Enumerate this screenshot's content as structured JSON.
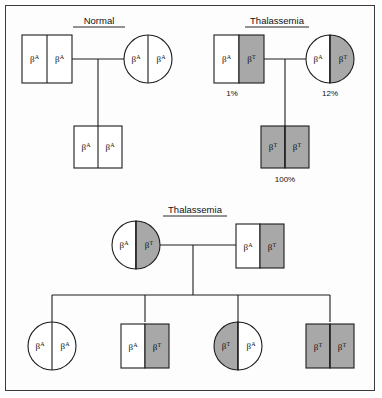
{
  "figure": {
    "title_normal": "Normal",
    "title_thalassemia": "Thalassemia",
    "allele_normal": "β",
    "allele_normal_sup": "A",
    "allele_thal": "β",
    "allele_thal_sup": "T",
    "colors": {
      "affected_fill": "#a8a8a8",
      "unaffected_fill": "#ffffff",
      "stroke": "#1d1d1d",
      "background": "#fdfdfd",
      "frame": "#3b3b3b"
    }
  },
  "panels": [
    {
      "id": "panel-normal",
      "title": "Normal",
      "parents": [
        {
          "role": "father",
          "sex": "male",
          "shape": "square",
          "left_allele": "β",
          "left_sup": "A",
          "right_allele": "β",
          "right_sup": "A",
          "left_shaded": false,
          "right_shaded": false,
          "percent": ""
        },
        {
          "role": "mother",
          "sex": "female",
          "shape": "circle",
          "left_allele": "β",
          "left_sup": "A",
          "right_allele": "β",
          "right_sup": "A",
          "left_shaded": false,
          "right_shaded": false,
          "percent": ""
        }
      ],
      "children": [
        {
          "role": "child",
          "sex": "male",
          "shape": "square",
          "left_allele": "β",
          "left_sup": "A",
          "right_allele": "β",
          "right_sup": "A",
          "left_shaded": false,
          "right_shaded": false,
          "percent": ""
        }
      ]
    },
    {
      "id": "panel-thalassemia-top",
      "title": "Thalassemia",
      "parents": [
        {
          "role": "father",
          "sex": "male",
          "shape": "square",
          "left_allele": "β",
          "left_sup": "A",
          "right_allele": "β",
          "right_sup": "T",
          "left_shaded": false,
          "right_shaded": true,
          "percent": "1%"
        },
        {
          "role": "mother",
          "sex": "female",
          "shape": "circle",
          "left_allele": "β",
          "left_sup": "A",
          "right_allele": "β",
          "right_sup": "T",
          "left_shaded": false,
          "right_shaded": true,
          "percent": "12%"
        }
      ],
      "children": [
        {
          "role": "child",
          "sex": "male",
          "shape": "square",
          "left_allele": "β",
          "left_sup": "T",
          "right_allele": "β",
          "right_sup": "T",
          "left_shaded": true,
          "right_shaded": true,
          "percent": "100%"
        }
      ]
    },
    {
      "id": "panel-thalassemia-bottom",
      "title": "Thalassemia",
      "parents": [
        {
          "role": "mother",
          "sex": "female",
          "shape": "circle",
          "left_allele": "β",
          "left_sup": "A",
          "right_allele": "β",
          "right_sup": "T",
          "left_shaded": false,
          "right_shaded": true,
          "percent": ""
        },
        {
          "role": "father",
          "sex": "male",
          "shape": "square",
          "left_allele": "β",
          "left_sup": "A",
          "right_allele": "β",
          "right_sup": "T",
          "left_shaded": false,
          "right_shaded": true,
          "percent": ""
        }
      ],
      "children": [
        {
          "role": "child-1",
          "sex": "female",
          "shape": "circle",
          "left_allele": "β",
          "left_sup": "A",
          "right_allele": "β",
          "right_sup": "A",
          "left_shaded": false,
          "right_shaded": false,
          "percent": ""
        },
        {
          "role": "child-2",
          "sex": "male",
          "shape": "square",
          "left_allele": "β",
          "left_sup": "A",
          "right_allele": "β",
          "right_sup": "T",
          "left_shaded": false,
          "right_shaded": true,
          "percent": ""
        },
        {
          "role": "child-3",
          "sex": "female",
          "shape": "circle",
          "left_allele": "β",
          "left_sup": "T",
          "right_allele": "β",
          "right_sup": "A",
          "left_shaded": true,
          "right_shaded": false,
          "percent": ""
        },
        {
          "role": "child-4",
          "sex": "male",
          "shape": "square",
          "left_allele": "β",
          "left_sup": "T",
          "right_allele": "β",
          "right_sup": "T",
          "left_shaded": true,
          "right_shaded": true,
          "percent": ""
        }
      ]
    }
  ]
}
